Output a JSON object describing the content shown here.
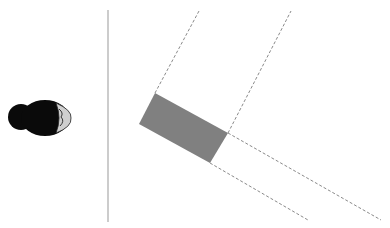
{
  "diagram": {
    "width": 390,
    "height": 228,
    "background": "#ffffff",
    "colors": {
      "rect_fill": "#808080",
      "dashed_line": "#8a8a8a",
      "divider_line": "#aaaaaa",
      "figure_body": "#0a0a0a",
      "figure_face": "#cfcfcf"
    },
    "divider": {
      "x": 108,
      "y1": 10,
      "y2": 222
    },
    "rectangle": {
      "points": [
        [
          155,
          93
        ],
        [
          228,
          133
        ],
        [
          210,
          163
        ],
        [
          139,
          124
        ]
      ]
    },
    "dashed_lines": [
      {
        "from": [
          155,
          93
        ],
        "to": [
          199,
          11
        ]
      },
      {
        "from": [
          228,
          133
        ],
        "to": [
          291,
          11
        ]
      },
      {
        "from": [
          228,
          133
        ],
        "to": [
          381,
          220
        ]
      },
      {
        "from": [
          210,
          163
        ],
        "to": [
          308,
          220
        ]
      }
    ],
    "figure": {
      "label": "person-top-view",
      "cx": 40,
      "cy": 118,
      "facing": "right"
    }
  }
}
